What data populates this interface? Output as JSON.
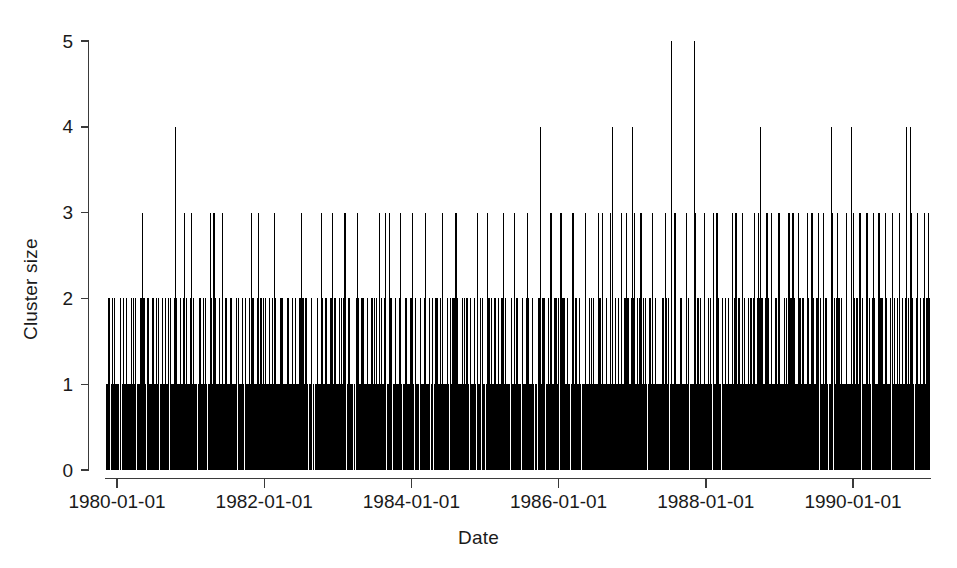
{
  "chart_data": {
    "type": "bar",
    "style": "spike-histogram",
    "title": "",
    "subtitle": "",
    "xlabel": "Date",
    "ylabel": "Cluster size",
    "grid": false,
    "legend": null,
    "legend_position": "none",
    "xlim": [
      "1979-07-01",
      "1991-03-01"
    ],
    "ylim": [
      0,
      5
    ],
    "y_ticks": [
      0,
      1,
      2,
      3,
      4,
      5
    ],
    "y_tick_labels": [
      "0",
      "1",
      "2",
      "3",
      "4",
      "5"
    ],
    "x_ticks": [
      "1980-01-01",
      "1982-01-01",
      "1984-01-01",
      "1986-01-01",
      "1988-01-01",
      "1990-01-01"
    ],
    "x_tick_labels": [
      "1980-01-01",
      "1982-01-01",
      "1984-01-01",
      "1986-01-01",
      "1990-01-01",
      "1990-01-01"
    ],
    "x_tick_labels_actual": [
      "1980-01-01",
      "1982-01-01",
      "1984-01-01",
      "1986-01-01",
      "1988-01-01",
      "1990-01-01"
    ],
    "x_axis_type": "date",
    "series_name": "Cluster size",
    "color": "#000000",
    "n_points": 1268,
    "value_counts": {
      "1": 900,
      "2": 280,
      "3": 77,
      "4": 9,
      "5": 2
    },
    "x_frac_values_4": [
      0.0855,
      0.5275,
      0.614,
      0.6385,
      0.7935,
      0.8795,
      0.9035,
      0.97,
      0.9748
    ],
    "x_frac_values_5": [
      0.6855,
      0.7135
    ],
    "x_frac_values_3": [
      0.0455,
      0.128,
      0.132,
      0.177,
      0.1855,
      0.2755,
      0.332,
      0.3395,
      0.344,
      0.372,
      0.451,
      0.463,
      0.5665,
      0.5975,
      0.6125,
      0.625,
      0.631,
      0.6415,
      0.649,
      0.663,
      0.679,
      0.69,
      0.7045,
      0.715,
      0.7365,
      0.741,
      0.76,
      0.764,
      0.786,
      0.791,
      0.8015,
      0.816,
      0.828,
      0.833,
      0.85,
      0.856,
      0.864,
      0.87,
      0.881,
      0.887,
      0.8975,
      0.906,
      0.914,
      0.9225,
      0.93,
      0.937,
      0.945,
      0.953,
      0.962,
      0.97,
      0.976,
      0.984,
      0.992,
      0.096,
      0.105,
      0.142,
      0.205,
      0.238,
      0.262,
      0.2905,
      0.306,
      0.358,
      0.388,
      0.409,
      0.425,
      0.482,
      0.496,
      0.512,
      0.54,
      0.552,
      0.582,
      0.602,
      0.7255,
      0.772,
      0.807,
      0.84,
      0.997
    ]
  },
  "axes": {
    "y_title": "Cluster size",
    "x_title": "Date"
  }
}
